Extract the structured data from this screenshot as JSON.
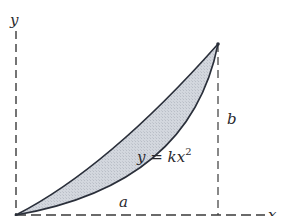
{
  "figure": {
    "type": "area-between-curves",
    "labels": {
      "y_axis": "y",
      "x_axis": "x",
      "width": "a",
      "height": "b",
      "curve_eq_lhs": "y = kx",
      "curve_eq_exp": "2"
    },
    "colors": {
      "stroke": "#2a2f3a",
      "fill": "#cfd3da",
      "axis": "#3a3a3a"
    },
    "curves": [
      {
        "name": "line",
        "equation": "y = (b/a)x",
        "from": [
          0,
          0
        ],
        "to": [
          "a",
          "b"
        ]
      },
      {
        "name": "parabola",
        "equation": "y = kx^2",
        "from": [
          0,
          0
        ],
        "to": [
          "a",
          "b"
        ]
      }
    ]
  }
}
